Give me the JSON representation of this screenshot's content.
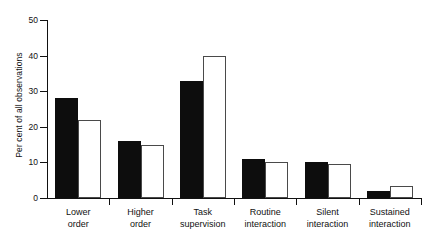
{
  "chart_data": {
    "type": "bar",
    "title": "",
    "xlabel": "",
    "ylabel": "Per cent of all observations",
    "ylim": [
      0,
      50
    ],
    "yticks": [
      0,
      10,
      20,
      30,
      40,
      50
    ],
    "ytick_labels": [
      "0",
      "10",
      "20",
      "30",
      "40",
      "50"
    ],
    "grid": false,
    "legend": "none",
    "categories": [
      "Lower order",
      "Higher order",
      "Task supervision",
      "Routine interaction",
      "Silent interaction",
      "Sustained interaction"
    ],
    "category_lines": [
      [
        "Lower",
        "order"
      ],
      [
        "Higher",
        "order"
      ],
      [
        "Task",
        "supervision"
      ],
      [
        "Routine",
        "interaction"
      ],
      [
        "Silent",
        "interaction"
      ],
      [
        "Sustained",
        "interaction"
      ]
    ],
    "series": [
      {
        "name": "filled",
        "color": "#0d0d0d",
        "values": [
          28,
          16,
          33,
          11,
          10,
          2
        ]
      },
      {
        "name": "open",
        "color": "#ffffff",
        "edge_color": "#4a4a4a",
        "values": [
          22,
          15,
          40,
          10,
          9.5,
          3.5
        ]
      }
    ]
  }
}
